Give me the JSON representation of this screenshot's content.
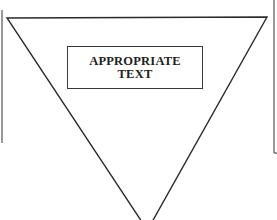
{
  "diagram": {
    "shape": "inverted-triangle",
    "label_lines": [
      "APPROPRIATE",
      "TEXT"
    ],
    "colors": {
      "background": "#ffffff",
      "stroke": "#2a2a2a"
    }
  }
}
